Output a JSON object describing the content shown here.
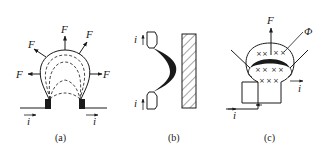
{
  "figure": {
    "panels": [
      {
        "id": "a",
        "caption": "(a)",
        "labels": {
          "force": "F",
          "current": "i"
        },
        "description": "Arc loop between two electrodes with dashed inner arcs; forces F pointing outward"
      },
      {
        "id": "b",
        "caption": "(b)",
        "labels": {
          "current": "i"
        },
        "description": "Arc between two electrodes bowed toward hatched ferromagnetic plate"
      },
      {
        "id": "c",
        "caption": "(c)",
        "labels": {
          "force": "F",
          "flux": "Φ",
          "current": "i"
        },
        "description": "Arc in magnetic field (crosses) with blowout coil; force F upward"
      }
    ],
    "colors": {
      "ink": "#1a1a1a",
      "background": "#ffffff"
    }
  }
}
